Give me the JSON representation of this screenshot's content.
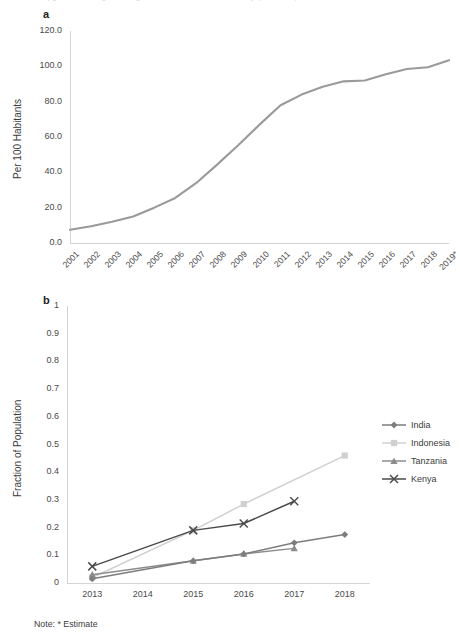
{
  "figure": {
    "cutoff_header": "supgentinal mergen tomigrated in Stitems corrermanity (thecome)",
    "note": "Note: * Estimate",
    "panel_a_letter": "a",
    "panel_b_letter": "b"
  },
  "legend": {
    "items": [
      {
        "label": "India",
        "color": "#7d7d7d",
        "marker": "diamond"
      },
      {
        "label": "Indonesia",
        "color": "#d0d0d0",
        "marker": "square"
      },
      {
        "label": "Tanzania",
        "color": "#8c8c8c",
        "marker": "triangle"
      },
      {
        "label": "Kenya",
        "color": "#4a4a4a",
        "marker": "cross"
      }
    ]
  },
  "chart_data": [
    {
      "id": "chart-a",
      "type": "line",
      "title": "",
      "xlabel": "",
      "ylabel": "Per 100 Habitants",
      "ylim": [
        0,
        120
      ],
      "yticks": [
        "0.0",
        "20.0",
        "40.0",
        "60.0",
        "80.0",
        "100.0",
        "120.0"
      ],
      "ytick_values": [
        0,
        20,
        40,
        60,
        80,
        100,
        120
      ],
      "grid": false,
      "legend_position": "none",
      "categories": [
        "2001",
        "2002",
        "2003",
        "2004",
        "2005",
        "2006",
        "2007",
        "2008",
        "2009",
        "2010",
        "2011",
        "2012",
        "2013",
        "2014",
        "2015",
        "2016",
        "2017",
        "2018",
        "2019*"
      ],
      "series": [
        {
          "name": "Mobile cellular subscriptions",
          "color": "#9a9a9a",
          "values": [
            7.5,
            9.5,
            12.0,
            15.0,
            20.0,
            25.5,
            34.0,
            44.5,
            55.5,
            67.0,
            78.0,
            84.0,
            88.5,
            91.5,
            92.0,
            95.5,
            98.5,
            99.5,
            103.5
          ]
        }
      ]
    },
    {
      "id": "chart-b",
      "type": "line",
      "title": "",
      "xlabel": "",
      "ylabel": "Fraction of Population",
      "ylim": [
        0,
        1
      ],
      "yticks": [
        "0",
        "0.1",
        "0.2",
        "0.3",
        "0.4",
        "0.5",
        "0.6",
        "0.7",
        "0.8",
        "0.9",
        "1"
      ],
      "ytick_values": [
        0,
        0.1,
        0.2,
        0.3,
        0.4,
        0.5,
        0.6,
        0.7,
        0.8,
        0.9,
        1
      ],
      "grid": false,
      "legend_position": "right",
      "categories": [
        "2013",
        "2014",
        "2015",
        "2016",
        "2017",
        "2018"
      ],
      "series": [
        {
          "name": "India",
          "color": "#7d7d7d",
          "marker": "diamond",
          "x": [
            2013,
            2015,
            2016,
            2017,
            2018
          ],
          "values": [
            0.015,
            0.08,
            0.105,
            0.145,
            0.175
          ]
        },
        {
          "name": "Indonesia",
          "color": "#d0d0d0",
          "marker": "square",
          "x": [
            2013,
            2015,
            2016,
            2018
          ],
          "values": [
            0.02,
            0.19,
            0.285,
            0.46
          ]
        },
        {
          "name": "Tanzania",
          "color": "#8c8c8c",
          "marker": "triangle",
          "x": [
            2013,
            2015,
            2016,
            2017
          ],
          "values": [
            0.03,
            0.08,
            0.105,
            0.125
          ]
        },
        {
          "name": "Kenya",
          "color": "#4a4a4a",
          "marker": "cross",
          "x": [
            2013,
            2015,
            2016,
            2017
          ],
          "values": [
            0.06,
            0.19,
            0.215,
            0.295
          ]
        }
      ]
    }
  ]
}
